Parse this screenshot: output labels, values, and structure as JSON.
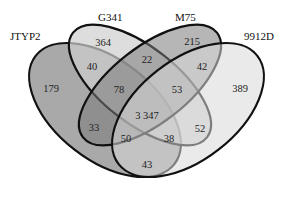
{
  "diagram": {
    "type": "venn-4-set",
    "sets": [
      {
        "name": "JTYP2",
        "color": "#8c8c8c"
      },
      {
        "name": "G341",
        "color": "#c9c9c9"
      },
      {
        "name": "M75",
        "color": "#8f8f8f"
      },
      {
        "name": "9912D",
        "color": "#d2d2d2"
      }
    ],
    "regions": {
      "JTYP2_only": "179",
      "G341_only": "364",
      "M75_only": "215",
      "9912D_only": "389",
      "JTYP2_G341": "40",
      "G341_M75": "22",
      "M75_9912D": "42",
      "JTYP2_G341_M75": "78",
      "G341_M75_9912D": "53",
      "all_four": "3 347",
      "JTYP2_M75": "33",
      "JTYP2_M75_9912D": "50",
      "JTYP2_G341_9912D": "38",
      "G341_9912D": "52",
      "JTYP2_9912D": "43"
    }
  }
}
